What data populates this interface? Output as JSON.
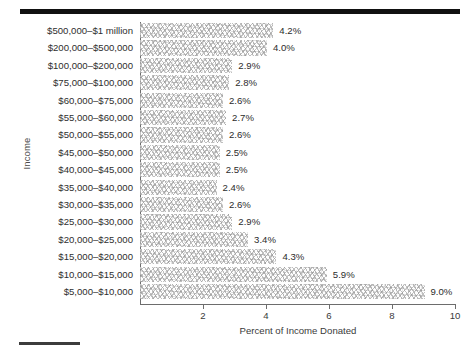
{
  "figure": {
    "top_rule": "horizontal-rule",
    "bottom_rule": "horizontal-rule"
  },
  "chart_data": {
    "type": "bar",
    "orientation": "horizontal",
    "title": "",
    "xlabel": "Percent of Income Donated",
    "ylabel": "Income",
    "xlim": [
      0,
      10
    ],
    "xticks": [
      2,
      4,
      6,
      8,
      10
    ],
    "xtick_labels": [
      "2",
      "4",
      "6",
      "8",
      "10"
    ],
    "grid": false,
    "legend": null,
    "categories": [
      "$500,000–$1 million",
      "$200,000–$500,000",
      "$100,000–$200,000",
      "$75,000–$100,000",
      "$60,000–$75,000",
      "$55,000–$60,000",
      "$50,000–$55,000",
      "$45,000–$50,000",
      "$40,000–$45,000",
      "$35,000–$40,000",
      "$30,000–$35,000",
      "$25,000–$30,000",
      "$20,000–$25,000",
      "$15,000–$20,000",
      "$10,000–$15,000",
      "$5,000–$10,000"
    ],
    "values": [
      4.2,
      4.0,
      2.9,
      2.8,
      2.6,
      2.7,
      2.6,
      2.5,
      2.5,
      2.4,
      2.6,
      2.9,
      3.4,
      4.3,
      5.9,
      9.0
    ],
    "value_labels": [
      "4.2%",
      "4.0%",
      "2.9%",
      "2.8%",
      "2.6%",
      "2.7%",
      "2.6%",
      "2.5%",
      "2.5%",
      "2.4%",
      "2.6%",
      "2.9%",
      "3.4%",
      "4.3%",
      "5.9%",
      "9.0%"
    ]
  },
  "colors": {
    "rule": "#111111",
    "axis": "#6d6d6d",
    "text": "#2e2e2e",
    "bar_fill": "#fefefe",
    "bar_hatch": "#969696"
  }
}
